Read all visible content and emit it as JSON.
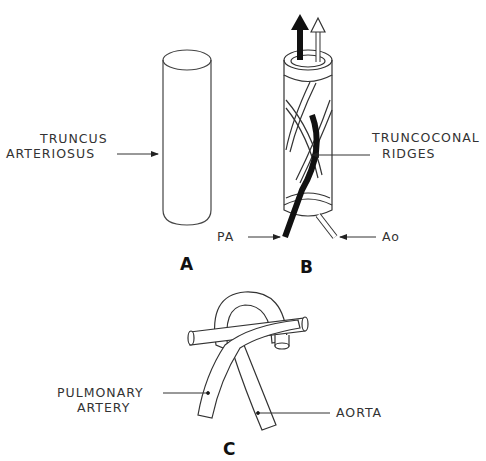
{
  "figure": {
    "panel_a": {
      "letter": "A",
      "label_line1": "TRUNCUS",
      "label_line2": "ARTERIOSUS"
    },
    "panel_b": {
      "letter": "B",
      "label_ridges_line1": "TRUNCOCONAL",
      "label_ridges_line2": "RIDGES",
      "label_pa": "PA",
      "label_ao": "Ao"
    },
    "panel_c": {
      "letter": "C",
      "label_pulmonary_line1": "PULMONARY",
      "label_pulmonary_line2": "ARTERY",
      "label_aorta": "AORTA"
    },
    "colors": {
      "line": "#333333",
      "fill_dark": "#111111",
      "background": "#ffffff"
    }
  }
}
